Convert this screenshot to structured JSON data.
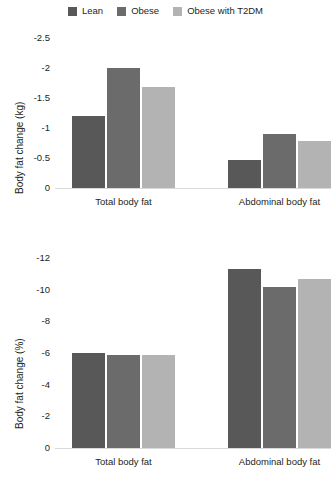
{
  "legend": {
    "items": [
      {
        "label": "Lean",
        "color": "#585858"
      },
      {
        "label": "Obese",
        "color": "#6b6b6b"
      },
      {
        "label": "Obese with T2DM",
        "color": "#b3b3b3"
      }
    ]
  },
  "chart_data": [
    {
      "type": "bar",
      "id": "body-fat-change-kg",
      "title": "",
      "xlabel": "",
      "ylabel": "Body fat change (kg)",
      "categories": [
        "Total body fat",
        "Abdominal body fat"
      ],
      "yticks": [
        "0",
        "-0.5",
        "-1",
        "-1.5",
        "-2",
        "-2.5"
      ],
      "ylim": [
        0,
        -2.5
      ],
      "inverted_y": true,
      "grid": false,
      "legend_position": "top",
      "series": [
        {
          "name": "Lean",
          "color": "#585858",
          "values": [
            -1.2,
            -0.47
          ]
        },
        {
          "name": "Obese",
          "color": "#6b6b6b",
          "values": [
            -2.0,
            -0.9
          ]
        },
        {
          "name": "Obese with T2DM",
          "color": "#b3b3b3",
          "values": [
            -1.68,
            -0.78
          ]
        }
      ]
    },
    {
      "type": "bar",
      "id": "body-fat-change-pct",
      "title": "",
      "xlabel": "",
      "ylabel": "Body fat change (%)",
      "categories": [
        "Total body fat",
        "Abdominal body fat"
      ],
      "yticks": [
        "0",
        "-2",
        "-4",
        "-6",
        "-8",
        "-10",
        "-12"
      ],
      "ylim": [
        0,
        -12
      ],
      "inverted_y": true,
      "grid": false,
      "legend_position": "top",
      "series": [
        {
          "name": "Lean",
          "color": "#585858",
          "values": [
            -6.0,
            -11.3
          ]
        },
        {
          "name": "Obese",
          "color": "#6b6b6b",
          "values": [
            -5.85,
            -10.15
          ]
        },
        {
          "name": "Obese with T2DM",
          "color": "#b3b3b3",
          "values": [
            -5.85,
            -10.7
          ]
        }
      ]
    }
  ]
}
